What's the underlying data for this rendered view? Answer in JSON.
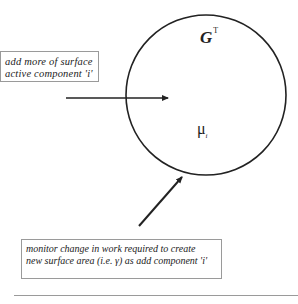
{
  "diagram": {
    "input_box": {
      "lines": [
        "add more of surface",
        "active component 'i'"
      ]
    },
    "output_box": {
      "lines": [
        "monitor change in work required to create",
        "new surface area (i.e. γ) as add component 'i'"
      ]
    },
    "circle": {
      "symbol_top": "G",
      "symbol_top_superscript": "T",
      "symbol_bottom": "μ",
      "symbol_bottom_subscript": "i"
    },
    "colors": {
      "stroke": "#222222",
      "box_border": "#9a9a9a"
    }
  }
}
